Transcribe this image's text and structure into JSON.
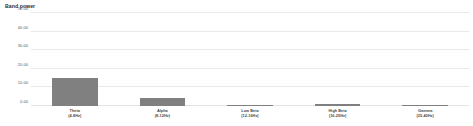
{
  "chart_data": {
    "type": "bar",
    "title": "Band power",
    "xlabel": "",
    "ylabel": "",
    "ylim": [
      0,
      50
    ],
    "grid": true,
    "legend": "none",
    "bar_color": "#808080",
    "gridline_color": "#e9e9e9",
    "yticks": [
      "0.00",
      "10.00",
      "20.00",
      "30.00",
      "40.00",
      "50.00"
    ],
    "ytick_values": [
      0,
      10,
      20,
      30,
      40,
      50
    ],
    "categories": [
      "Theta",
      "Alpha",
      "Low Beta",
      "High Beta",
      "Gamma"
    ],
    "category_ranges": [
      "(4-8Hz)",
      "(8-12Hz)",
      "(12-16Hz)",
      "(16-25Hz)",
      "(25-40Hz)"
    ],
    "values": [
      15.1,
      4.2,
      0.5,
      0.9,
      0.4
    ]
  }
}
